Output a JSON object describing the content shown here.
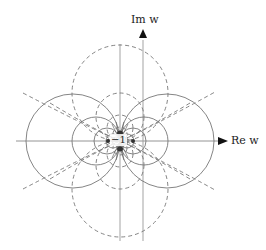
{
  "figure": {
    "type": "conformal-map-coordinate-curves",
    "im_axis_label": "Im w",
    "re_axis_label": "Re w",
    "point_label": "−1",
    "solid_curve_style": "solid gray circles tangent at −1, centered on real axis",
    "dashed_curve_style": "dashed circles tangent at −1, centered on line Re w = −1",
    "colors": {
      "stroke": "#777777",
      "axis": "#888888",
      "arrow": "#111111",
      "background": "#ffffff"
    },
    "circle_radii_px": [
      47,
      24,
      13,
      7,
      4
    ],
    "tangent_point_px": [
      120,
      141
    ]
  }
}
